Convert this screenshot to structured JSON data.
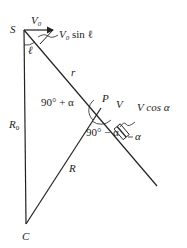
{
  "diagram": {
    "points": {
      "S": {
        "label": "S",
        "x": 24,
        "y": 30
      },
      "P": {
        "label": "P",
        "x": 101,
        "y": 108
      },
      "C": {
        "label": "C",
        "x": 26,
        "y": 224
      }
    },
    "labels": {
      "v0": "V",
      "v0_sub": "0",
      "v0_sin_l": "V",
      "v0_sin_l_sub": "0",
      "v0_sin_l_rest": " sin ℓ",
      "ell": "ℓ",
      "r": "r",
      "angle_upper": "90° + α",
      "angle_lower": "90° − α",
      "v": "V",
      "v_cos_a": "V cos α",
      "alpha": "α",
      "r0": "R",
      "r0_sub": "0",
      "big_r": "R",
      "s": "S",
      "p": "P",
      "c": "C"
    },
    "line_color": "#222222"
  }
}
